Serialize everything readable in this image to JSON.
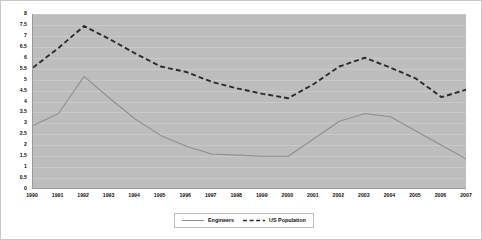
{
  "chart_data": {
    "type": "line",
    "title": "",
    "xlabel": "",
    "ylabel": "",
    "x": [
      1990,
      1991,
      1992,
      1993,
      1994,
      1995,
      1996,
      1997,
      1998,
      1999,
      2000,
      2001,
      2002,
      2003,
      2004,
      2005,
      2006,
      2007
    ],
    "xtick_labels": [
      "1990",
      "1991",
      "1992",
      "1993",
      "1994",
      "1995",
      "1996",
      "1997",
      "1998",
      "1999",
      "2000",
      "2001",
      "2002",
      "2003",
      "2004",
      "2005",
      "2006",
      "2007"
    ],
    "ytick_labels": [
      "0",
      "0.5",
      "1",
      "1.5",
      "2",
      "2.5",
      "3",
      "3.5",
      "4",
      "4.5",
      "5",
      "5.5",
      "6",
      "6.5",
      "7",
      "7.5",
      "8"
    ],
    "yticks": [
      0,
      0.5,
      1,
      1.5,
      2,
      2.5,
      3,
      3.5,
      4,
      4.5,
      5,
      5.5,
      6,
      6.5,
      7,
      7.5,
      8
    ],
    "ylim": [
      0,
      8
    ],
    "xlim": [
      1990,
      2007
    ],
    "grid": "horizontal",
    "legend_position": "bottom-center",
    "plot_background": "#bdbdbd",
    "figure_background": "#ffffff",
    "series": [
      {
        "name": "Engineers",
        "style": "solid",
        "color": "#8f8f8f",
        "values": [
          2.9,
          3.45,
          5.15,
          4.15,
          3.2,
          2.45,
          1.95,
          1.6,
          1.55,
          1.5,
          1.5,
          2.3,
          3.1,
          3.45,
          3.3,
          2.65,
          2.0,
          1.35
        ]
      },
      {
        "name": "US Population",
        "style": "dashed",
        "color": "#2b2b2b",
        "values": [
          5.55,
          6.45,
          7.45,
          6.85,
          6.2,
          5.6,
          5.35,
          4.9,
          4.6,
          4.35,
          4.15,
          4.8,
          5.6,
          6.0,
          5.55,
          5.05,
          4.2,
          4.55
        ]
      }
    ],
    "legend": [
      {
        "label": "Engineers",
        "style": "solid",
        "color": "#8f8f8f"
      },
      {
        "label": "US Population",
        "style": "dashed",
        "color": "#2b2b2b"
      }
    ]
  }
}
